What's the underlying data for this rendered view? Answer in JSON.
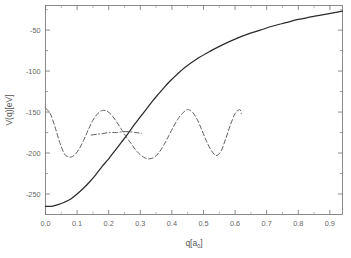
{
  "chart_data": {
    "type": "line",
    "title": "",
    "xlabel": "q[a_0]",
    "xlabel_main": "q[a",
    "xlabel_sub": "0",
    "xlabel_tail": "]",
    "ylabel": "V(q)[eV]",
    "xlim": [
      0.0,
      0.94
    ],
    "ylim": [
      -275,
      -20
    ],
    "grid": false,
    "legend": "none",
    "x_ticks": [
      "0.0",
      "0.1",
      "0.2",
      "0.3",
      "0.4",
      "0.5",
      "0.6",
      "0.7",
      "0.8",
      "0.9"
    ],
    "x_tick_values": [
      0.0,
      0.1,
      0.2,
      0.3,
      0.4,
      0.5,
      0.6,
      0.7,
      0.8,
      0.9
    ],
    "y_ticks": [
      "-50",
      "-100",
      "-150",
      "-200",
      "-250"
    ],
    "y_tick_values": [
      -50,
      -100,
      -150,
      -200,
      -250
    ],
    "series": [
      {
        "name": "solid-potential",
        "style": "solid",
        "color": "#2b2b2b",
        "x": [
          0.0,
          0.02,
          0.04,
          0.06,
          0.08,
          0.1,
          0.12,
          0.14,
          0.16,
          0.18,
          0.2,
          0.22,
          0.24,
          0.26,
          0.28,
          0.3,
          0.32,
          0.34,
          0.36,
          0.38,
          0.4,
          0.44,
          0.48,
          0.52,
          0.56,
          0.6,
          0.64,
          0.68,
          0.72,
          0.76,
          0.8,
          0.84,
          0.88,
          0.94
        ],
        "values": [
          -265,
          -265,
          -263,
          -260,
          -256,
          -250,
          -243,
          -235,
          -226,
          -216,
          -207,
          -197,
          -187,
          -177,
          -166,
          -156,
          -146,
          -136,
          -127,
          -118,
          -110,
          -96,
          -85,
          -76,
          -68,
          -61,
          -55,
          -50,
          -45,
          -41,
          -37,
          -34,
          -31,
          -27
        ]
      },
      {
        "name": "dashed-oscillatory",
        "style": "dashed",
        "color": "#555555",
        "x": [
          0.0,
          0.015,
          0.03,
          0.045,
          0.06,
          0.075,
          0.09,
          0.105,
          0.12,
          0.135,
          0.15,
          0.165,
          0.18,
          0.195,
          0.21,
          0.225,
          0.24,
          0.255,
          0.27,
          0.285,
          0.3,
          0.315,
          0.33,
          0.345,
          0.36,
          0.375,
          0.39,
          0.405,
          0.42,
          0.435,
          0.45,
          0.465,
          0.48,
          0.495,
          0.51,
          0.525,
          0.54,
          0.555,
          0.57,
          0.585,
          0.6,
          0.615,
          0.62
        ],
        "values": [
          -145,
          -152,
          -168,
          -187,
          -201,
          -205,
          -203,
          -196,
          -185,
          -172,
          -160,
          -152,
          -148,
          -149,
          -154,
          -162,
          -171,
          -180,
          -188,
          -196,
          -202,
          -206,
          -207,
          -205,
          -199,
          -190,
          -179,
          -168,
          -158,
          -151,
          -147,
          -150,
          -159,
          -172,
          -186,
          -197,
          -203,
          -198,
          -183,
          -166,
          -152,
          -147,
          -152
        ]
      },
      {
        "name": "dashdot-flat",
        "style": "dashdot",
        "color": "#555555",
        "x": [
          0.145,
          0.165,
          0.185,
          0.205,
          0.225,
          0.245,
          0.265,
          0.285,
          0.305
        ],
        "values": [
          -178,
          -177,
          -176,
          -175,
          -175,
          -174,
          -174,
          -175,
          -176
        ]
      }
    ]
  },
  "axes": {
    "y_label_text": "V(q)[eV]"
  }
}
